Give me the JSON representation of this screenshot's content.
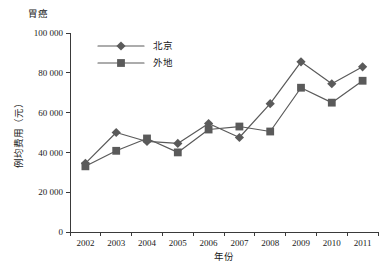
{
  "chart_data": {
    "type": "line",
    "title": "胃癌",
    "xlabel": "年份",
    "ylabel": "例均费用（元）",
    "categories": [
      "2002",
      "2003",
      "2004",
      "2005",
      "2006",
      "2007",
      "2008",
      "2009",
      "2010",
      "2011"
    ],
    "x": [
      2002,
      2003,
      2004,
      2005,
      2006,
      2007,
      2008,
      2009,
      2010,
      2011
    ],
    "ylim": [
      0,
      100000
    ],
    "yticks": [
      0,
      20000,
      40000,
      60000,
      80000,
      100000
    ],
    "ytick_labels": [
      "0",
      "20 000",
      "40 000",
      "60 000",
      "80 000",
      "100 000"
    ],
    "grid": false,
    "legend_position": "top-left-inside",
    "series": [
      {
        "name": "北京",
        "marker": "diamond",
        "color": "#5a5a5a",
        "values": [
          34500,
          50000,
          45500,
          44500,
          54500,
          47500,
          64500,
          85500,
          74500,
          83000
        ]
      },
      {
        "name": "外地",
        "marker": "square",
        "color": "#5a5a5a",
        "values": [
          33000,
          40800,
          47000,
          40000,
          51500,
          53000,
          50500,
          72500,
          65000,
          76000
        ]
      }
    ]
  },
  "colors": {
    "series_beijing": "#5a5a5a",
    "series_waidi": "#5a5a5a",
    "axis": "#3a3a3a",
    "text": "#1a1a1a",
    "background": "#ffffff"
  }
}
